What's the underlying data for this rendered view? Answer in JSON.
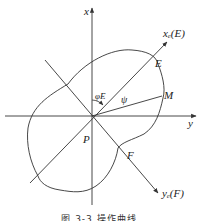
{
  "figure": {
    "caption": "图 3-3 操作曲线",
    "labels": {
      "x_axis": "x",
      "y_axis": "y",
      "xe_axis": "xₑ(E)",
      "ye_axis": "yₑ(F)",
      "point_E": "E",
      "point_M": "M",
      "point_F": "F",
      "point_P": "P",
      "angle_phi": "φE",
      "angle_psi": "ψ"
    },
    "colors": {
      "stroke": "#333333",
      "background": "#ffffff"
    }
  }
}
